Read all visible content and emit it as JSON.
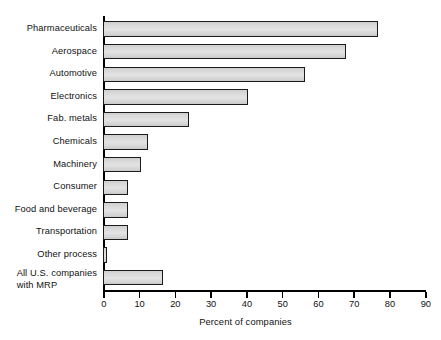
{
  "chart_data": {
    "type": "bar",
    "orientation": "horizontal",
    "title": "",
    "subtitle": "",
    "xlabel": "Percent of companies",
    "ylabel": "",
    "xlim": [
      0,
      90
    ],
    "xticks": [
      0,
      10,
      20,
      30,
      40,
      50,
      60,
      70,
      80,
      90
    ],
    "xtick_labels": [
      "0",
      "10",
      "20",
      "30",
      "40",
      "50",
      "60",
      "70",
      "80",
      "90"
    ],
    "grid": false,
    "legend": null,
    "categories": [
      "Pharmaceuticals",
      "Aerospace",
      "Automotive",
      "Electronics",
      "Fab. metals",
      "Chemicals",
      "Machinery",
      "Consumer",
      "Food and beverage",
      "Transportation",
      "Other process",
      "All U.S. companies\nwith MRP"
    ],
    "values": [
      77,
      68,
      56.5,
      40.5,
      24,
      12.5,
      10.5,
      7,
      7,
      7,
      1,
      16.8
    ],
    "bar_fill_color": "#dcdcdc",
    "bar_border_color": "#1b1b1b",
    "axis_color": "#000000",
    "background_color": "#ffffff"
  }
}
